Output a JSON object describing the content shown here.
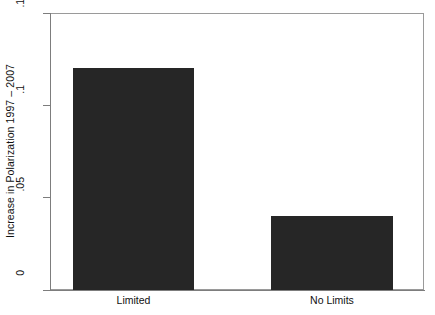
{
  "chart_data": {
    "type": "bar",
    "title": "",
    "xlabel": "",
    "ylabel": "Increase in Polarization 1997 – 2007",
    "categories": [
      "Limited",
      "No Limits"
    ],
    "values": [
      0.12,
      0.04
    ],
    "series": [
      {
        "name": "Increase in Polarization 1997 – 2007",
        "values": [
          0.12,
          0.04
        ]
      }
    ],
    "ylim": [
      0,
      0.15
    ],
    "yticks": [
      0,
      0.05,
      0.1,
      0.15
    ],
    "ytick_labels": [
      "0",
      ".05",
      ".1",
      ".15"
    ],
    "grid": false,
    "legend": false,
    "bar_color": "#262626",
    "axis_color": "#7d7d7d",
    "background_color": "#ffffff"
  },
  "axes": {
    "y_title": "Increase in Polarization 1997 – 2007",
    "y_tick_0": "0",
    "y_tick_1": ".05",
    "y_tick_2": ".1",
    "y_tick_3": ".15"
  },
  "categories": {
    "cat_0": "Limited",
    "cat_1": "No Limits"
  }
}
